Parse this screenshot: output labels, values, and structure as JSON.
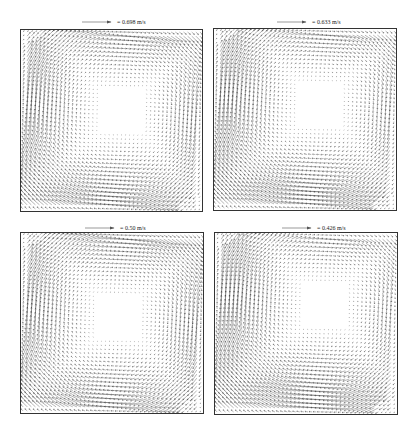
{
  "figure": {
    "panels": [
      {
        "id": "top-left",
        "ref_label": "= 0.698 m/s",
        "ref_speed": 0.698,
        "box": [
          20,
          29,
          183,
          183
        ],
        "ref_pos": [
          82,
          17
        ]
      },
      {
        "id": "top-right",
        "ref_label": "= 0.633 m/s",
        "ref_speed": 0.633,
        "box": [
          213,
          28,
          184,
          183
        ],
        "ref_pos": [
          277,
          17
        ]
      },
      {
        "id": "bottom-left",
        "ref_label": "= 0.50 m/s",
        "ref_speed": 0.5,
        "box": [
          20,
          232,
          184,
          182
        ],
        "ref_pos": [
          85,
          223
        ]
      },
      {
        "id": "bottom-right",
        "ref_label": "= 0.426 m/s",
        "ref_speed": 0.426,
        "box": [
          214,
          232,
          184,
          183
        ],
        "ref_pos": [
          282,
          223
        ]
      }
    ],
    "arrow_color": "#222222",
    "frame_color": "#333333",
    "grid_n": 44,
    "rotation": "clockwise"
  }
}
